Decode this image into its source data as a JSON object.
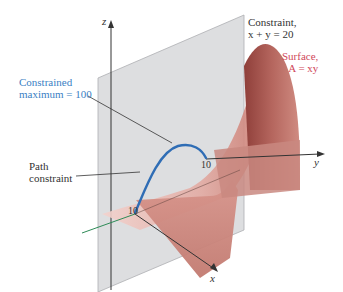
{
  "figure": {
    "axes": {
      "x": "x",
      "y": "y",
      "z": "z"
    },
    "ticks": {
      "x_tick": "10",
      "y_tick": "10"
    },
    "labels": {
      "constraint_line1": "Constraint,",
      "constraint_line2": "x + y = 20",
      "surface_line1": "Surface,",
      "surface_line2": "A = xy",
      "max_line1": "Constrained",
      "max_line2": "maximum = 100",
      "path_line1": "Path",
      "path_line2": "constraint"
    },
    "colors": {
      "plane": "#d9dadc",
      "plane_edge": "#9a9ca0",
      "surface_light": "#f0c4be",
      "surface_mid": "#d99a92",
      "surface_dark": "#a9544c",
      "curve": "#2f6db5",
      "label_blue": "#3a7fc4",
      "label_red": "#d0485a",
      "x_axis_back": "#2e8b57",
      "axis": "#333333"
    }
  }
}
